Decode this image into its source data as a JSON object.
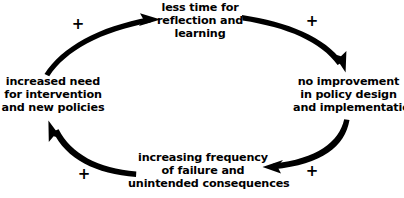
{
  "diagram": {
    "type": "causal-loop-diagram",
    "loop_type": "reinforcing",
    "background_color": "#ffffff",
    "ink_color": "#000000",
    "nodes": [
      {
        "id": "less-time-for-reflection",
        "position": "top",
        "lines": [
          "less time for",
          "reflection and",
          "learning"
        ]
      },
      {
        "id": "no-improvement-in-policy",
        "position": "right",
        "lines": [
          "no improvement",
          "in policy design",
          "and implementation"
        ]
      },
      {
        "id": "increasing-frequency-of-failure",
        "position": "bottom",
        "lines": [
          "increasing frequency",
          "of failure and",
          "unintended consequences"
        ]
      },
      {
        "id": "increased-need-for-intervention",
        "position": "left",
        "lines": [
          "increased need",
          "for intervention",
          "and new policies"
        ]
      }
    ],
    "links": [
      {
        "id": "left-to-top",
        "from": "increased-need-for-intervention",
        "to": "less-time-for-reflection",
        "polarity": "+"
      },
      {
        "id": "top-to-right",
        "from": "less-time-for-reflection",
        "to": "no-improvement-in-policy",
        "polarity": "+"
      },
      {
        "id": "right-to-bottom",
        "from": "no-improvement-in-policy",
        "to": "increasing-frequency-of-failure",
        "polarity": "+"
      },
      {
        "id": "bottom-to-left",
        "from": "increasing-frequency-of-failure",
        "to": "increased-need-for-intervention",
        "polarity": "+"
      }
    ]
  }
}
